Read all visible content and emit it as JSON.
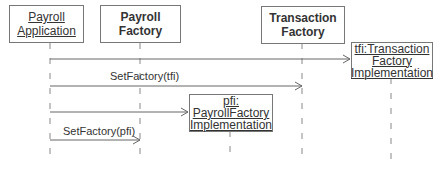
{
  "objects": [
    {
      "id": "payroll-application",
      "lines": [
        "Payroll",
        "Application"
      ],
      "underline": true,
      "bold": false
    },
    {
      "id": "payroll-factory",
      "lines": [
        "Payroll",
        "Factory"
      ],
      "underline": false,
      "bold": true
    },
    {
      "id": "transaction-factory",
      "lines": [
        "Transaction",
        "Factory"
      ],
      "underline": false,
      "bold": true
    },
    {
      "id": "tfi",
      "lines": [
        "tfi:Transaction",
        "Factory",
        "Implementation"
      ],
      "underline": true,
      "bold": false
    },
    {
      "id": "pfi",
      "lines": [
        "pfi:",
        "PayrollFactory",
        "Implementation"
      ],
      "underline": true,
      "bold": false
    }
  ],
  "messages": [
    {
      "from": "payroll-application",
      "to": "tfi",
      "label": ""
    },
    {
      "from": "payroll-application",
      "to": "transaction-factory",
      "label": "SetFactory(tfi)"
    },
    {
      "from": "payroll-application",
      "to": "pfi",
      "label": ""
    },
    {
      "from": "payroll-application",
      "to": "payroll-factory",
      "label": "SetFactory(pfi)"
    }
  ]
}
